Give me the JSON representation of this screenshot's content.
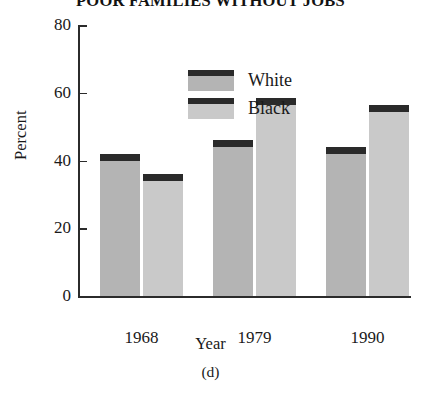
{
  "chart_data": {
    "type": "bar",
    "title": "POOR FAMILIES WITHOUT JOBS",
    "panel_label": "(d)",
    "xlabel": "Year",
    "ylabel": "Percent",
    "categories": [
      "1968",
      "1979",
      "1990"
    ],
    "series": [
      {
        "name": "White",
        "values": [
          42,
          46,
          44
        ],
        "color": "#b4b4b4",
        "cap_color": "#2a2a2a"
      },
      {
        "name": "Black",
        "values": [
          36,
          58.5,
          56.5
        ],
        "color": "#c9c9c9",
        "cap_color": "#2a2a2a"
      }
    ],
    "ylim": [
      0,
      80
    ],
    "yticks": [
      0,
      20,
      40,
      60,
      80
    ],
    "ytick_labels": [
      "0",
      "20",
      "40",
      "60",
      "80"
    ],
    "grid": false,
    "legend_position": "upper-left-inside"
  },
  "legend": {
    "items": [
      {
        "label": "White"
      },
      {
        "label": "Black"
      }
    ]
  }
}
